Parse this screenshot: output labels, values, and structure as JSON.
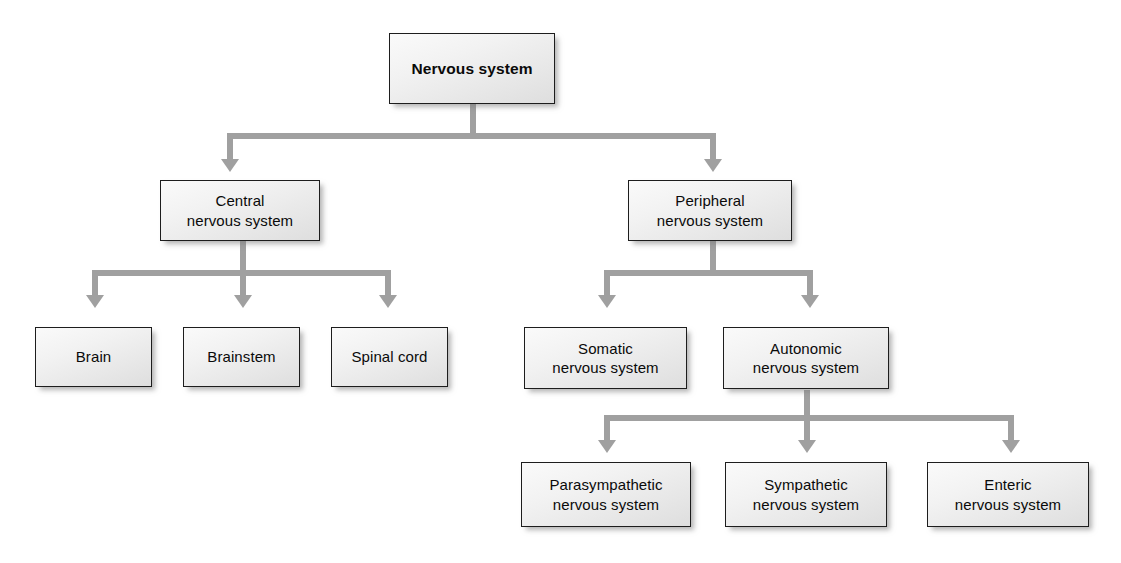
{
  "diagram": {
    "type": "hierarchy-flowchart",
    "colors": {
      "box_fill_light": "#fafafa",
      "box_fill_dark": "#dedede",
      "box_border": "#1d1d1d",
      "connector": "#a0a0a0",
      "text": "#0a0a0a",
      "background": "#ffffff"
    },
    "nodes": {
      "root": "Nervous system",
      "central": "Central\nnervous system",
      "peripheral": "Peripheral\nnervous system",
      "brain": "Brain",
      "brainstem": "Brainstem",
      "spinal_cord": "Spinal cord",
      "somatic": "Somatic\nnervous system",
      "autonomic": "Autonomic\nnervous system",
      "parasympathetic": "Parasympathetic\nnervous system",
      "sympathetic": "Sympathetic\nnervous system",
      "enteric": "Enteric\nnervous system"
    },
    "edges": [
      {
        "from": "root",
        "to": "central"
      },
      {
        "from": "root",
        "to": "peripheral"
      },
      {
        "from": "central",
        "to": "brain"
      },
      {
        "from": "central",
        "to": "brainstem"
      },
      {
        "from": "central",
        "to": "spinal_cord"
      },
      {
        "from": "peripheral",
        "to": "somatic"
      },
      {
        "from": "peripheral",
        "to": "autonomic"
      },
      {
        "from": "autonomic",
        "to": "parasympathetic"
      },
      {
        "from": "autonomic",
        "to": "sympathetic"
      },
      {
        "from": "autonomic",
        "to": "enteric"
      }
    ]
  }
}
